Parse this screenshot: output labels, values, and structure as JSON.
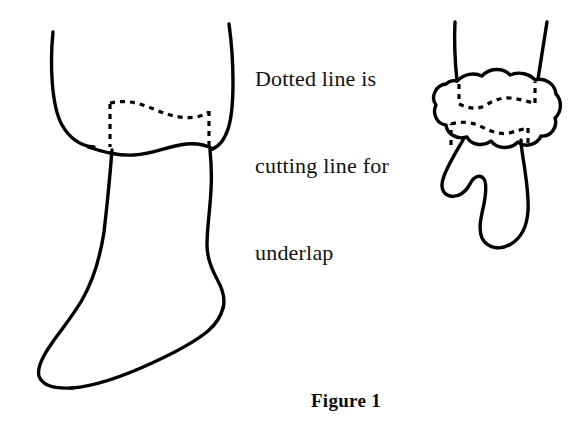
{
  "figure": {
    "caption": "Figure 1",
    "annotation": {
      "lines": [
        "Dotted line is",
        "cutting line for",
        "underlap"
      ],
      "full_text": "Dotted line is cutting line for underlap"
    },
    "colors": {
      "background": "#ffffff",
      "stroke": "#000000",
      "text": "#111111"
    },
    "objects": {
      "left_drawing": {
        "name": "sock-outline-flat",
        "description": "Outline drawing of a sock laid flat, showing cuff, leg, heel, foot and toe",
        "dashed_marking": "cutting line for underlap across the cuff"
      },
      "right_drawing": {
        "name": "sock-outline-gathered",
        "description": "Outline drawing of the same sock gathered or scrunched at the cuff into a bunched cloud shape with the foot hanging below",
        "dashed_marking": "two cutting lines for underlap across the gathered cuff"
      }
    }
  }
}
